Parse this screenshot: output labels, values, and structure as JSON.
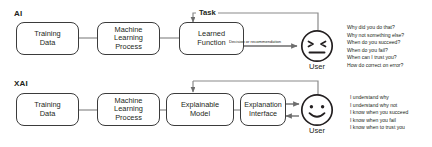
{
  "diagram": {
    "title_visible": false,
    "sections": [
      {
        "key": "ai",
        "label": "AI",
        "nodes": [
          {
            "id": "ai-training-data",
            "text": "Training\nData"
          },
          {
            "id": "ai-ml-process",
            "text": "Machine\nLearning\nProcess"
          },
          {
            "id": "ai-learned-function",
            "text": "Learned\nFunction"
          }
        ],
        "edge_labels": {
          "task": "Task",
          "decision": "Decision or recommendation"
        },
        "user": {
          "label": "User",
          "face": "confused-face-icon",
          "expression": "frustrated"
        },
        "questions": [
          "Why did you do that?",
          "Why not something else?",
          "When do you succeed?",
          "When do you fail?",
          "When can I trust you?",
          "How do correct on error?"
        ]
      },
      {
        "key": "xai",
        "label": "XAI",
        "nodes": [
          {
            "id": "xai-training-data",
            "text": "Training\nData"
          },
          {
            "id": "xai-ml-process",
            "text": "Machine\nLearning\nProcess"
          },
          {
            "id": "xai-explainable-model",
            "text": "Explainable\nModel"
          },
          {
            "id": "xai-explanation-interface",
            "text": "Explanation\nInterface"
          }
        ],
        "edge_labels": {
          "task": "Task",
          "decision": ""
        },
        "user": {
          "label": "User",
          "face": "smiley-face-icon",
          "expression": "happy"
        },
        "questions": [
          "I understand why",
          "I understand why not",
          "I know when you succeed",
          "I know when you fail",
          "I know when to trust you"
        ]
      }
    ],
    "colors": {
      "stroke": "#3b3b3b",
      "wire": "#8a8a8a",
      "arrow": "#6d6d6d",
      "text": "#231f20",
      "background": "#ffffff"
    }
  }
}
